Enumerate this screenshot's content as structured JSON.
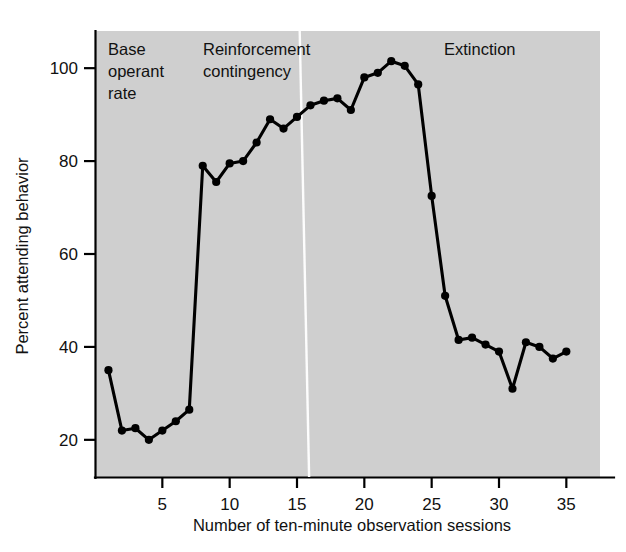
{
  "figure": {
    "background_color": "#ffffff",
    "plot_background_color": "#cfcfcf",
    "line_color": "#000000",
    "divider_color": "#fdfdfd",
    "top_partial_text": ""
  },
  "chart_data": {
    "type": "line",
    "title": "",
    "xlabel": "Number of ten-minute observation sessions",
    "ylabel": "Percent attending behavior",
    "xlim": [
      0,
      37.5
    ],
    "ylim": [
      12,
      108
    ],
    "xticks": [
      5,
      10,
      15,
      20,
      25,
      30,
      35
    ],
    "xticklabels": [
      "5",
      "10",
      "15",
      "20",
      "25",
      "30",
      "35"
    ],
    "yticks": [
      20,
      40,
      60,
      80,
      100
    ],
    "yticklabels": [
      "20",
      "40",
      "60",
      "80",
      "100"
    ],
    "grid": false,
    "legend": false,
    "marker": "filled-circle",
    "series": [
      {
        "name": "Percent attending behavior",
        "x": [
          1,
          2,
          3,
          4,
          5,
          6,
          7,
          8,
          9,
          10,
          11,
          12,
          13,
          14,
          15,
          16,
          17,
          18,
          19,
          20,
          21,
          22,
          23,
          24,
          25,
          26,
          27,
          28,
          29,
          30,
          31,
          32,
          33,
          34,
          35
        ],
        "values": [
          35,
          22,
          22.5,
          20,
          22,
          24,
          26.5,
          79,
          75.5,
          79.5,
          80,
          84,
          89,
          87,
          89.5,
          92,
          93,
          93.5,
          91,
          98,
          99,
          101.5,
          100.5,
          96.5,
          72.5,
          51,
          41.5,
          42,
          40.5,
          39,
          31,
          41,
          40,
          37.5,
          39
        ]
      }
    ],
    "annotations": [
      {
        "name": "phase-label-baseline",
        "text": "Base\noperant\nrate",
        "lines": [
          "Base",
          "operant",
          "rate"
        ],
        "x_session": 1.0,
        "y_percent": 104
      },
      {
        "name": "phase-label-reinforcement",
        "text": "Reinforcement\ncontingency",
        "lines": [
          "Reinforcement",
          "contingency"
        ],
        "x_session": 6.0,
        "y_percent": 104
      },
      {
        "name": "phase-label-extinction",
        "text": "Extinction",
        "lines": [
          "Extinction"
        ],
        "x_session": 23.5,
        "y_percent": 104
      }
    ],
    "dividers": [
      {
        "name": "phase-divider-baseline-reinforcement",
        "x_session_top": 15.2,
        "x_session_bottom": 15.9
      }
    ]
  },
  "labels": {
    "x_axis_title": "Number of ten-minute observation sessions",
    "y_axis_title": "Percent attending behavior",
    "phase_baseline_line1": "Base",
    "phase_baseline_line2": "operant",
    "phase_baseline_line3": "rate",
    "phase_reinforcement_line1": "Reinforcement",
    "phase_reinforcement_line2": "contingency",
    "phase_extinction": "Extinction",
    "ytick_20": "20",
    "ytick_40": "40",
    "ytick_60": "60",
    "ytick_80": "80",
    "ytick_100": "100",
    "xtick_5": "5",
    "xtick_10": "10",
    "xtick_15": "15",
    "xtick_20": "20",
    "xtick_25": "25",
    "xtick_30": "30",
    "xtick_35": "35"
  }
}
